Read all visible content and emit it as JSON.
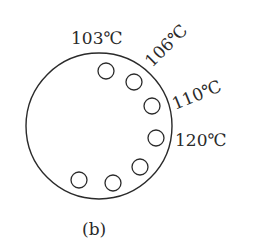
{
  "diagram": {
    "outer_circle": {
      "cx": 99,
      "cy": 126,
      "r": 73
    },
    "holes": [
      {
        "cx": 106,
        "cy": 71,
        "r": 8
      },
      {
        "cx": 134,
        "cy": 82,
        "r": 8
      },
      {
        "cx": 152,
        "cy": 106,
        "r": 8
      },
      {
        "cx": 156,
        "cy": 138,
        "r": 8
      },
      {
        "cx": 140,
        "cy": 167,
        "r": 8
      },
      {
        "cx": 113,
        "cy": 183,
        "r": 8
      },
      {
        "cx": 79,
        "cy": 180,
        "r": 8
      }
    ],
    "labels": [
      {
        "text": "103℃",
        "x": 71,
        "y": 44,
        "rotate": 0
      },
      {
        "text": "106℃",
        "x": 152,
        "y": 68,
        "rotate": -45
      },
      {
        "text": "110℃",
        "x": 175,
        "y": 110,
        "rotate": -22
      },
      {
        "text": "120℃",
        "x": 175,
        "y": 146,
        "rotate": 0
      }
    ],
    "caption": "(b)",
    "stroke_color": "#2a2a2a"
  }
}
